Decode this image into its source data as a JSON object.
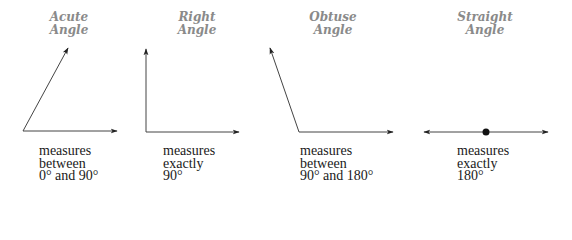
{
  "angles": [
    {
      "key": "acute",
      "title_line1": "Acute",
      "title_line2": "Angle",
      "desc_line1": "measures",
      "desc_line2": "between",
      "desc_line3": "0° and 90°"
    },
    {
      "key": "right",
      "title_line1": "Right",
      "title_line2": "Angle",
      "desc_line1": "measures",
      "desc_line2": "exactly",
      "desc_line3": "90°"
    },
    {
      "key": "obtuse",
      "title_line1": "Obtuse",
      "title_line2": "Angle",
      "desc_line1": "measures",
      "desc_line2": "between",
      "desc_line3": "90° and 180°"
    },
    {
      "key": "straight",
      "title_line1": "Straight",
      "title_line2": "Angle",
      "desc_line1": "measures",
      "desc_line2": "exactly",
      "desc_line3": "180°"
    }
  ],
  "colors": {
    "title": "#8a8a8a",
    "line": "#333333",
    "text": "#1a1a1a"
  }
}
